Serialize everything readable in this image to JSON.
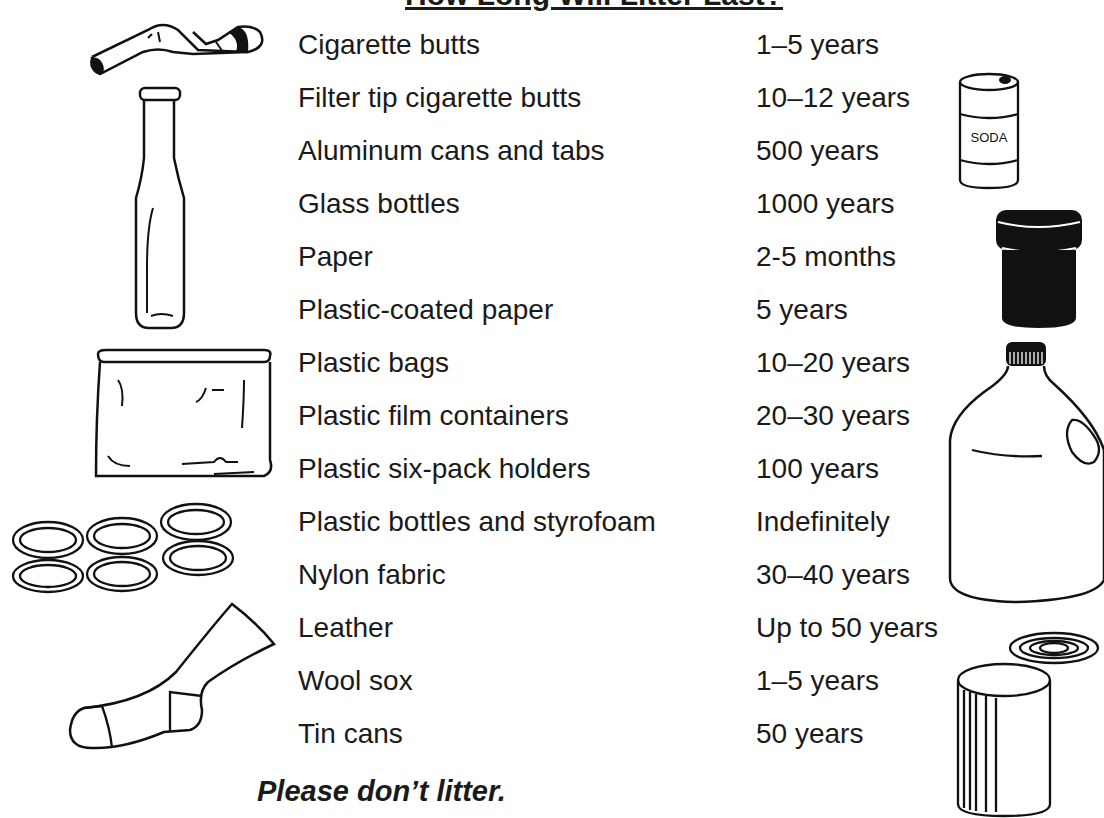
{
  "title": "How Long Will Litter Last?",
  "rows": [
    {
      "item": "Cigarette butts",
      "duration": "1–5 years"
    },
    {
      "item": "Filter tip cigarette butts",
      "duration": "10–12 years"
    },
    {
      "item": "Aluminum cans and tabs",
      "duration": "500 years"
    },
    {
      "item": "Glass bottles",
      "duration": "1000 years"
    },
    {
      "item": "Paper",
      "duration": "2-5 months"
    },
    {
      "item": "Plastic-coated paper",
      "duration": "5 years"
    },
    {
      "item": "Plastic bags",
      "duration": "10–20 years"
    },
    {
      "item": "Plastic film containers",
      "duration": "20–30 years"
    },
    {
      "item": "Plastic six-pack holders",
      "duration": "100 years"
    },
    {
      "item": "Plastic bottles and styrofoam",
      "duration": "Indefinitely"
    },
    {
      "item": "Nylon fabric",
      "duration": "30–40 years"
    },
    {
      "item": "Leather",
      "duration": "Up to 50 years"
    },
    {
      "item": "Wool sox",
      "duration": "1–5 years"
    },
    {
      "item": "Tin cans",
      "duration": "50 years"
    }
  ],
  "footer": "Please don’t litter.",
  "illustrations": {
    "soda_can_label": "SODA",
    "icons": [
      "cigarette-butt-icon",
      "glass-bottle-icon",
      "plastic-bag-icon",
      "six-pack-rings-icon",
      "sock-icon",
      "soda-can-icon",
      "film-container-icon",
      "plastic-jug-icon",
      "tin-can-icon"
    ]
  }
}
